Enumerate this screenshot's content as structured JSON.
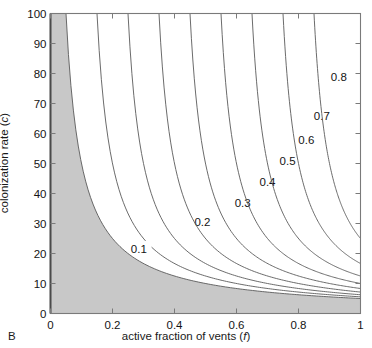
{
  "panel": {
    "label": "B"
  },
  "axes": {
    "x": {
      "title_text": "active fraction of vents (",
      "title_symbol": "f",
      "title_close": ")",
      "ticks": [
        "0",
        "0.2",
        "0.4",
        "0.6",
        "0.8",
        "1"
      ],
      "tick_values": [
        0,
        0.2,
        0.4,
        0.6,
        0.8,
        1
      ],
      "range": [
        0,
        1
      ]
    },
    "y": {
      "title_text": "colonization rate (",
      "title_symbol": "c",
      "title_close": ")",
      "ticks": [
        "0",
        "10",
        "20",
        "30",
        "40",
        "50",
        "60",
        "70",
        "80",
        "90",
        "100"
      ],
      "tick_values": [
        0,
        10,
        20,
        30,
        40,
        50,
        60,
        70,
        80,
        90,
        100
      ],
      "range": [
        0,
        100
      ]
    }
  },
  "colors": {
    "extinction_fill": "#c8c8c8",
    "contour_line": "#5a5a5a",
    "axis_line": "#7a7a7a",
    "text": "#141414"
  },
  "chart_data": {
    "type": "line",
    "title": "",
    "xlabel": "active fraction of vents (f)",
    "ylabel": "colonization rate (c)",
    "xlim": [
      0,
      1
    ],
    "ylim": [
      0,
      100
    ],
    "grid": false,
    "legend": "none",
    "model": {
      "extinction_rate": 5,
      "relation": "c = e / (f - p)"
    },
    "shaded_region": {
      "name": "extinction-region",
      "fill": "#c8c8c8",
      "boundary_level": 0,
      "boundary_points": [
        {
          "f": 0.05,
          "c": 100
        },
        {
          "f": 0.0625,
          "c": 80
        },
        {
          "f": 0.0833,
          "c": 60
        },
        {
          "f": 0.1,
          "c": 50
        },
        {
          "f": 0.125,
          "c": 40
        },
        {
          "f": 0.1667,
          "c": 30
        },
        {
          "f": 0.25,
          "c": 20
        },
        {
          "f": 0.3333,
          "c": 15
        },
        {
          "f": 0.5,
          "c": 10
        },
        {
          "f": 0.7143,
          "c": 7
        },
        {
          "f": 1.0,
          "c": 5
        }
      ]
    },
    "contours": [
      {
        "level": 0.1,
        "label": "0.1",
        "label_at": {
          "f": 0.285,
          "c": 21.5
        },
        "points": [
          {
            "f": 0.15,
            "c": 100
          },
          {
            "f": 0.1625,
            "c": 80
          },
          {
            "f": 0.1833,
            "c": 60
          },
          {
            "f": 0.2,
            "c": 50
          },
          {
            "f": 0.225,
            "c": 40
          },
          {
            "f": 0.2667,
            "c": 30
          },
          {
            "f": 0.35,
            "c": 20
          },
          {
            "f": 0.4333,
            "c": 15
          },
          {
            "f": 0.6,
            "c": 10
          },
          {
            "f": 0.8143,
            "c": 7
          },
          {
            "f": 1.0,
            "c": 6.25
          }
        ]
      },
      {
        "level": 0.2,
        "label": "0.2",
        "label_at": {
          "f": 0.49,
          "c": 30.5
        },
        "points": [
          {
            "f": 0.25,
            "c": 100
          },
          {
            "f": 0.2625,
            "c": 80
          },
          {
            "f": 0.2833,
            "c": 60
          },
          {
            "f": 0.3,
            "c": 50
          },
          {
            "f": 0.325,
            "c": 40
          },
          {
            "f": 0.3667,
            "c": 30
          },
          {
            "f": 0.45,
            "c": 20
          },
          {
            "f": 0.5333,
            "c": 15
          },
          {
            "f": 0.7,
            "c": 10
          },
          {
            "f": 0.9143,
            "c": 7
          },
          {
            "f": 1.0,
            "c": 6.25
          }
        ]
      },
      {
        "level": 0.3,
        "label": "0.3",
        "label_at": {
          "f": 0.62,
          "c": 37
        },
        "points": [
          {
            "f": 0.35,
            "c": 100
          },
          {
            "f": 0.3625,
            "c": 80
          },
          {
            "f": 0.3833,
            "c": 60
          },
          {
            "f": 0.4,
            "c": 50
          },
          {
            "f": 0.425,
            "c": 40
          },
          {
            "f": 0.4667,
            "c": 30
          },
          {
            "f": 0.55,
            "c": 20
          },
          {
            "f": 0.6333,
            "c": 15
          },
          {
            "f": 0.8,
            "c": 10
          },
          {
            "f": 1.0,
            "c": 7.14
          }
        ]
      },
      {
        "level": 0.4,
        "label": "0.4",
        "label_at": {
          "f": 0.7,
          "c": 44
        },
        "points": [
          {
            "f": 0.45,
            "c": 100
          },
          {
            "f": 0.4625,
            "c": 80
          },
          {
            "f": 0.4833,
            "c": 60
          },
          {
            "f": 0.5,
            "c": 50
          },
          {
            "f": 0.525,
            "c": 40
          },
          {
            "f": 0.5667,
            "c": 30
          },
          {
            "f": 0.65,
            "c": 20
          },
          {
            "f": 0.7333,
            "c": 15
          },
          {
            "f": 0.9,
            "c": 10
          },
          {
            "f": 1.0,
            "c": 8.33
          }
        ]
      },
      {
        "level": 0.5,
        "label": "0.5",
        "label_at": {
          "f": 0.765,
          "c": 51
        },
        "points": [
          {
            "f": 0.55,
            "c": 100
          },
          {
            "f": 0.5625,
            "c": 80
          },
          {
            "f": 0.5833,
            "c": 60
          },
          {
            "f": 0.6,
            "c": 50
          },
          {
            "f": 0.625,
            "c": 40
          },
          {
            "f": 0.6667,
            "c": 30
          },
          {
            "f": 0.75,
            "c": 20
          },
          {
            "f": 0.8333,
            "c": 15
          },
          {
            "f": 1.0,
            "c": 10
          }
        ]
      },
      {
        "level": 0.6,
        "label": "0.6",
        "label_at": {
          "f": 0.825,
          "c": 58
        },
        "points": [
          {
            "f": 0.65,
            "c": 100
          },
          {
            "f": 0.6625,
            "c": 80
          },
          {
            "f": 0.6833,
            "c": 60
          },
          {
            "f": 0.7,
            "c": 50
          },
          {
            "f": 0.725,
            "c": 40
          },
          {
            "f": 0.7667,
            "c": 30
          },
          {
            "f": 0.85,
            "c": 20
          },
          {
            "f": 0.9333,
            "c": 15
          },
          {
            "f": 1.0,
            "c": 12.5
          }
        ]
      },
      {
        "level": 0.7,
        "label": "0.7",
        "label_at": {
          "f": 0.875,
          "c": 66
        },
        "points": [
          {
            "f": 0.75,
            "c": 100
          },
          {
            "f": 0.7625,
            "c": 80
          },
          {
            "f": 0.7833,
            "c": 60
          },
          {
            "f": 0.8,
            "c": 50
          },
          {
            "f": 0.825,
            "c": 40
          },
          {
            "f": 0.8667,
            "c": 30
          },
          {
            "f": 0.95,
            "c": 20
          },
          {
            "f": 1.0,
            "c": 16.67
          }
        ]
      },
      {
        "level": 0.8,
        "label": "0.8",
        "label_at": {
          "f": 0.93,
          "c": 79
        },
        "points": [
          {
            "f": 0.85,
            "c": 100
          },
          {
            "f": 0.8625,
            "c": 80
          },
          {
            "f": 0.8833,
            "c": 60
          },
          {
            "f": 0.9,
            "c": 50
          },
          {
            "f": 0.925,
            "c": 40
          },
          {
            "f": 0.9667,
            "c": 30
          },
          {
            "f": 1.0,
            "c": 25
          }
        ]
      }
    ]
  }
}
